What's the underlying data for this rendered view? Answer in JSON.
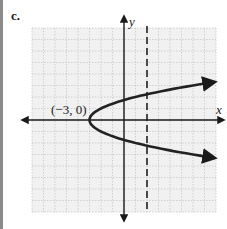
{
  "panel": {
    "label": "c."
  },
  "chart_data": {
    "type": "line",
    "title": "",
    "xlabel": "x",
    "ylabel": "y",
    "xlim": [
      -8,
      8
    ],
    "ylim": [
      -8,
      8
    ],
    "grid": true,
    "grid_step": 1,
    "series": [
      {
        "name": "parabola x = y^2 - 3",
        "equation": "x = y^2 - 3",
        "vertex": [
          -3,
          0
        ],
        "points": [
          [
            7.9,
            3.3
          ],
          [
            6,
            3
          ],
          [
            1,
            2
          ],
          [
            0,
            1.73
          ],
          [
            -2,
            1
          ],
          [
            -3,
            0
          ],
          [
            -2,
            -1
          ],
          [
            0,
            -1.73
          ],
          [
            1,
            -2
          ],
          [
            6,
            -3
          ],
          [
            7.9,
            -3.3
          ]
        ]
      },
      {
        "name": "dashed vertical line",
        "equation": "x = 2",
        "style": "dashed"
      }
    ],
    "annotations": [
      {
        "text": "(−3, 0)",
        "x": -3,
        "y": 0
      }
    ]
  },
  "colors": {
    "grid": "#b8b8b8",
    "grid_bg": "#f1f1f1",
    "curve": "#222222",
    "axis": "#1a1a1a",
    "side_bar": "#8a8a8a"
  }
}
